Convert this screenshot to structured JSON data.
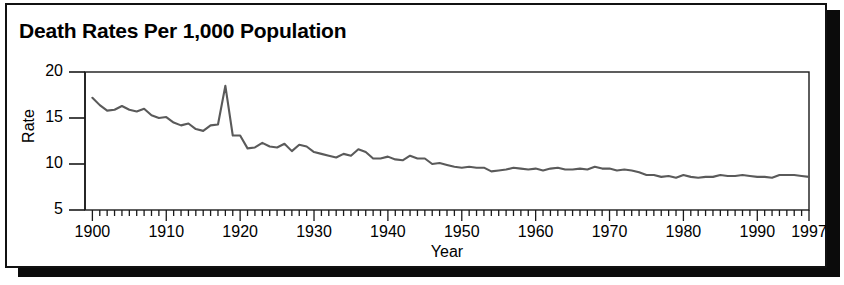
{
  "panel": {
    "title": "Death Rates Per 1,000 Population",
    "border_color": "#111111",
    "shadow_color": "#0b0b0b",
    "background_color": "#ffffff"
  },
  "chart_data": {
    "type": "line",
    "title": "Death Rates Per 1,000 Population",
    "subtitle": "",
    "xlabel": "Year",
    "ylabel": "Rate",
    "xlim": [
      1899,
      1997
    ],
    "ylim": [
      5,
      20
    ],
    "grid": false,
    "legend": null,
    "legend_position": "none",
    "line_color": "#5a5a5a",
    "axis_color": "#1a1a1a",
    "y_ticks": [
      5,
      10,
      15,
      20
    ],
    "y_tick_labels": [
      "5",
      "10",
      "15",
      "20"
    ],
    "x_ticks": [
      1900,
      1910,
      1920,
      1930,
      1940,
      1950,
      1960,
      1970,
      1980,
      1990,
      1997
    ],
    "x_tick_labels": [
      "1900",
      "1910",
      "1920",
      "1930",
      "1940",
      "1950",
      "1960",
      "1970",
      "1980",
      "1990",
      "1997"
    ],
    "x_minor_tick_interval": 1,
    "annotations": [],
    "x": [
      1900,
      1901,
      1902,
      1903,
      1904,
      1905,
      1906,
      1907,
      1908,
      1909,
      1910,
      1911,
      1912,
      1913,
      1914,
      1915,
      1916,
      1917,
      1918,
      1919,
      1920,
      1921,
      1922,
      1923,
      1924,
      1925,
      1926,
      1927,
      1928,
      1929,
      1930,
      1931,
      1932,
      1933,
      1934,
      1935,
      1936,
      1937,
      1938,
      1939,
      1940,
      1941,
      1942,
      1943,
      1944,
      1945,
      1946,
      1947,
      1948,
      1949,
      1950,
      1951,
      1952,
      1953,
      1954,
      1955,
      1956,
      1957,
      1958,
      1959,
      1960,
      1961,
      1962,
      1963,
      1964,
      1965,
      1966,
      1967,
      1968,
      1969,
      1970,
      1971,
      1972,
      1973,
      1974,
      1975,
      1976,
      1977,
      1978,
      1979,
      1980,
      1981,
      1982,
      1983,
      1984,
      1985,
      1986,
      1987,
      1988,
      1989,
      1990,
      1991,
      1992,
      1993,
      1994,
      1995,
      1996,
      1997
    ],
    "values": [
      17.2,
      16.4,
      15.8,
      15.9,
      16.3,
      15.9,
      15.7,
      16.0,
      15.3,
      15.0,
      15.1,
      14.5,
      14.2,
      14.4,
      13.8,
      13.6,
      14.2,
      14.3,
      18.5,
      13.1,
      13.1,
      11.7,
      11.8,
      12.3,
      11.9,
      11.8,
      12.2,
      11.4,
      12.1,
      11.9,
      11.3,
      11.1,
      10.9,
      10.7,
      11.1,
      10.9,
      11.6,
      11.3,
      10.6,
      10.6,
      10.8,
      10.5,
      10.4,
      10.9,
      10.6,
      10.6,
      10.0,
      10.1,
      9.9,
      9.7,
      9.6,
      9.7,
      9.6,
      9.6,
      9.2,
      9.3,
      9.4,
      9.6,
      9.5,
      9.4,
      9.5,
      9.3,
      9.5,
      9.6,
      9.4,
      9.4,
      9.5,
      9.4,
      9.7,
      9.5,
      9.5,
      9.3,
      9.4,
      9.3,
      9.1,
      8.8,
      8.8,
      8.6,
      8.7,
      8.5,
      8.8,
      8.6,
      8.5,
      8.6,
      8.6,
      8.8,
      8.7,
      8.7,
      8.8,
      8.7,
      8.6,
      8.6,
      8.5,
      8.8,
      8.8,
      8.8,
      8.7,
      8.6
    ],
    "note_on_scale": "Series drawn against the 5-20 Rate axis; 1918 influenza pandemic produces the single sharp peak near 18.5."
  },
  "axis": {
    "x_title": "Year",
    "y_title": "Rate"
  }
}
